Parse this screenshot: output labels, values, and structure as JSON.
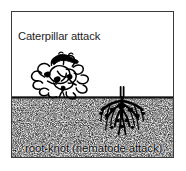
{
  "figure": {
    "labels": {
      "above_ground": "Caterpillar attack",
      "below_ground": "root-knot (nematode attack)"
    },
    "elements": {
      "plant": "cabbage-plant",
      "pest_above": "caterpillar",
      "pest_below": "root-knot-nematode-galls",
      "soil": "soil-stipple",
      "soil_line": "ground-line",
      "border": "figure-border"
    },
    "colors": {
      "ink": "#000000",
      "border": "#3a3a3a",
      "background": "#ffffff",
      "soil_stipple": "#2b2b2b"
    }
  }
}
